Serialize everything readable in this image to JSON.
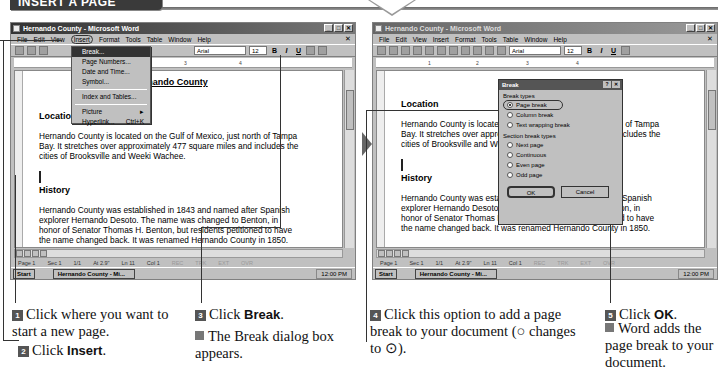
{
  "banner": {
    "title": "INSERT A PAGE BREAK"
  },
  "left_window": {
    "title": "Hernando County - Microsoft Word",
    "menu": [
      "File",
      "Edit",
      "View",
      "Insert",
      "Format",
      "Tools",
      "Table",
      "Window",
      "Help"
    ],
    "font": "Arial",
    "font_size": "12",
    "insert_menu": {
      "items": [
        {
          "label": "Break...",
          "selected": true
        },
        {
          "label": "Page Numbers..."
        },
        {
          "label": "Date and Time..."
        },
        {
          "label": "Symbol..."
        },
        {
          "label": "Index and Tables..."
        },
        {
          "label": "Picture",
          "submenu": "▸"
        },
        {
          "label": "Hyperlink...",
          "shortcut": "Ctrl+K"
        }
      ],
      "more": "⇊"
    },
    "doc": {
      "heading": "Hernando County",
      "section1_title": "Location",
      "section1_text": "Hernando County is located on the Gulf of Mexico, just north of Tampa Bay. It stretches over approximately 477 square miles and includes the cities of Brooksville and Weeki Wachee.",
      "section2_title": "History",
      "section2_text": "Hernando County was established in 1843 and named after Spanish explorer Hernando Desoto. The name was changed to Benton, in honor of Senator Thomas H. Benton, but residents petitioned to have the name changed back. It was renamed Hernando County in 1850."
    },
    "status": [
      "Page 1",
      "Sec 1",
      "1/1",
      "At 2.9\"",
      "Ln 11",
      "Col 1",
      "REC",
      "TRK",
      "EXT",
      "OVR"
    ],
    "taskbar": {
      "start": "Start",
      "task": "Hernando County - Mi...",
      "clock": "12:00 PM"
    }
  },
  "right_window": {
    "title": "Hernando County - Microsoft Word",
    "menu": [
      "File",
      "Edit",
      "View",
      "Insert",
      "Format",
      "Tools",
      "Table",
      "Window",
      "Help"
    ],
    "font": "Arial",
    "font_size": "12",
    "dialog": {
      "title": "Break",
      "help": "?",
      "close": "✕",
      "group1": "Break types",
      "break_types": [
        {
          "label": "Page break",
          "checked": true
        },
        {
          "label": "Column break"
        },
        {
          "label": "Text wrapping break"
        }
      ],
      "group2": "Section break types",
      "section_types": [
        {
          "label": "Next page"
        },
        {
          "label": "Continuous"
        },
        {
          "label": "Even page"
        },
        {
          "label": "Odd page"
        }
      ],
      "ok": "OK",
      "cancel": "Cancel"
    },
    "doc": {
      "section1_title": "Location",
      "section1_text": "Hernando County is located on the Gulf of Mexico, just north of Tampa Bay. It stretches over approximately 477 square miles and includes the cities of Brooksville and Weeki Wachee.",
      "section2_title": "History",
      "section2_text": "Hernando County was established in 1843 and named after Spanish explorer Hernando Desoto. The name was changed to Benton, in honor of Senator Thomas H. Benton, but residents petitioned to have the name changed back. It was renamed Hernando County in 1850."
    },
    "status": [
      "Page 1",
      "Sec 1",
      "1/1",
      "At 2.9\"",
      "Ln 11",
      "Col 1",
      "REC",
      "TRK",
      "EXT",
      "OVR"
    ],
    "taskbar": {
      "start": "Start",
      "task": "Hernando County - Mi...",
      "clock": "12:00 PM"
    }
  },
  "steps": {
    "s1": {
      "num": "1",
      "text": "Click where you want to start a new page."
    },
    "s2": {
      "num": "2",
      "pre": "Click ",
      "bold": "Insert",
      "post": "."
    },
    "s3": {
      "num": "3",
      "pre": "Click ",
      "bold": "Break",
      "post": "."
    },
    "s3_note": "The Break dialog box appears.",
    "s4": {
      "num": "4",
      "text": "Click this option to add a page break to your document (○ changes to ⊙)."
    },
    "s5": {
      "num": "5",
      "pre": "Click ",
      "bold": "OK",
      "post": "."
    },
    "s5_note": "Word adds the page break to your document."
  }
}
